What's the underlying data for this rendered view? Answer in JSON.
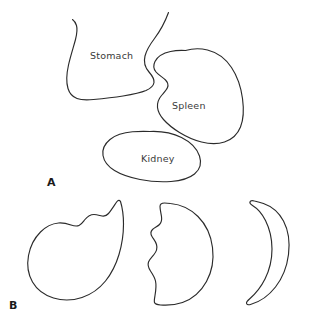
{
  "figure": {
    "background_color": "#ffffff",
    "stroke_color": "#2b2b2b",
    "label_color": "#3a3a3a",
    "panel_label_color": "#1a1a1a"
  },
  "panel_a": {
    "letter": "A",
    "organs": [
      {
        "name": "stomach",
        "label": "Stomach"
      },
      {
        "name": "spleen",
        "label": "Spleen"
      },
      {
        "name": "kidney",
        "label": "Kidney"
      }
    ]
  },
  "panel_b": {
    "letter": "B",
    "shapes": [
      {
        "name": "teardrop-comma-shape",
        "description": "teardrop"
      },
      {
        "name": "half-moon-scalloped-shape",
        "description": "half-moon"
      },
      {
        "name": "crescent-shape",
        "description": "crescent"
      }
    ]
  }
}
